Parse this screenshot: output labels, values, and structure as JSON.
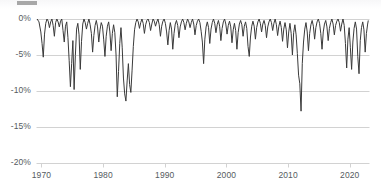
{
  "chart_data": {
    "type": "area",
    "title": "",
    "subtitle": "",
    "xlabel": "",
    "ylabel": "",
    "xlim": [
      1969.2,
      2023.2
    ],
    "ylim": [
      -20,
      0
    ],
    "grid": true,
    "legend_position": "none",
    "series_name": "Drawdown",
    "line_color": "#3a3a3a",
    "gridline_color": "#d2d2d2",
    "axis_text_color": "#555b61",
    "background_color": "#ffffff",
    "y_ticks": [
      "0%",
      "-5%",
      "-10%",
      "-15%",
      "-20%"
    ],
    "y_tick_values": [
      0,
      -5,
      -10,
      -15,
      -20
    ],
    "x_ticks": [
      "1970",
      "1980",
      "1990",
      "2000",
      "2010",
      "2020"
    ],
    "x_tick_values": [
      1970,
      1980,
      1990,
      2000,
      2010,
      2020
    ],
    "x": [
      1969.3,
      1969.6,
      1969.9,
      1970.1,
      1970.3,
      1970.5,
      1970.7,
      1970.9,
      1971.1,
      1971.3,
      1971.5,
      1971.7,
      1971.9,
      1972.1,
      1972.3,
      1972.5,
      1972.7,
      1972.9,
      1973.1,
      1973.3,
      1973.5,
      1973.7,
      1973.9,
      1974.1,
      1974.3,
      1974.5,
      1974.7,
      1974.9,
      1975.1,
      1975.3,
      1975.5,
      1975.7,
      1975.9,
      1976.1,
      1976.3,
      1976.5,
      1976.7,
      1976.9,
      1977.1,
      1977.3,
      1977.5,
      1977.7,
      1977.9,
      1978.1,
      1978.3,
      1978.5,
      1978.7,
      1978.9,
      1979.1,
      1979.3,
      1979.5,
      1979.7,
      1979.9,
      1980.1,
      1980.3,
      1980.5,
      1980.7,
      1980.9,
      1981.1,
      1981.3,
      1981.5,
      1981.7,
      1981.9,
      1982.1,
      1982.3,
      1982.5,
      1982.7,
      1982.9,
      1983.1,
      1983.3,
      1983.5,
      1983.7,
      1983.9,
      1984.1,
      1984.3,
      1984.5,
      1984.7,
      1984.9,
      1985.1,
      1985.3,
      1985.5,
      1985.7,
      1985.9,
      1986.1,
      1986.3,
      1986.5,
      1986.7,
      1986.9,
      1987.1,
      1987.3,
      1987.5,
      1987.7,
      1987.9,
      1988.1,
      1988.3,
      1988.5,
      1988.7,
      1988.9,
      1989.1,
      1989.3,
      1989.5,
      1989.7,
      1989.9,
      1990.1,
      1990.3,
      1990.5,
      1990.7,
      1990.9,
      1991.1,
      1991.3,
      1991.5,
      1991.7,
      1991.9,
      1992.1,
      1992.3,
      1992.5,
      1992.7,
      1992.9,
      1993.1,
      1993.3,
      1993.5,
      1993.7,
      1993.9,
      1994.1,
      1994.3,
      1994.5,
      1994.7,
      1994.9,
      1995.1,
      1995.3,
      1995.5,
      1995.7,
      1995.9,
      1996.1,
      1996.3,
      1996.5,
      1996.7,
      1996.9,
      1997.1,
      1997.3,
      1997.5,
      1997.7,
      1997.9,
      1998.1,
      1998.3,
      1998.5,
      1998.7,
      1998.9,
      1999.1,
      1999.3,
      1999.5,
      1999.7,
      1999.9,
      2000.1,
      2000.3,
      2000.5,
      2000.7,
      2000.9,
      2001.1,
      2001.3,
      2001.5,
      2001.7,
      2001.9,
      2002.1,
      2002.3,
      2002.5,
      2002.7,
      2002.9,
      2003.1,
      2003.3,
      2003.5,
      2003.7,
      2003.9,
      2004.1,
      2004.3,
      2004.5,
      2004.7,
      2004.9,
      2005.1,
      2005.3,
      2005.5,
      2005.7,
      2005.9,
      2006.1,
      2006.3,
      2006.5,
      2006.7,
      2006.9,
      2007.1,
      2007.3,
      2007.5,
      2007.7,
      2007.9,
      2008.1,
      2008.3,
      2008.5,
      2008.7,
      2008.9,
      2009.1,
      2009.3,
      2009.5,
      2009.7,
      2009.9,
      2010.1,
      2010.3,
      2010.5,
      2010.7,
      2010.9,
      2011.1,
      2011.3,
      2011.5,
      2011.7,
      2011.9,
      2012.1,
      2012.3,
      2012.5,
      2012.7,
      2012.9,
      2013.1,
      2013.3,
      2013.5,
      2013.7,
      2013.9,
      2014.1,
      2014.3,
      2014.5,
      2014.7,
      2014.9,
      2015.1,
      2015.3,
      2015.5,
      2015.7,
      2015.9,
      2016.1,
      2016.3,
      2016.5,
      2016.7,
      2016.9,
      2017.1,
      2017.3,
      2017.5,
      2017.7,
      2017.9,
      2018.1,
      2018.3,
      2018.5,
      2018.7,
      2018.9,
      2019.1,
      2019.3,
      2019.5,
      2019.7,
      2019.9,
      2020.1,
      2020.3,
      2020.5,
      2020.7,
      2020.9,
      2021.1,
      2021.3,
      2021.5,
      2021.7,
      2021.9,
      2022.1,
      2022.3,
      2022.5,
      2022.7,
      2022.9,
      2023.0
    ],
    "y": [
      0,
      -0.4,
      -1.8,
      -3.4,
      -5.3,
      -2.1,
      -0.6,
      0,
      -0.3,
      -1.2,
      -0.4,
      0,
      -0.9,
      -2.4,
      -0.5,
      0,
      -0.4,
      -1.1,
      -0.3,
      0,
      -1.6,
      -3.2,
      -1.0,
      -0.4,
      -2.6,
      -5.8,
      -9.4,
      -6.2,
      -3.0,
      -9.8,
      -5.1,
      -1.4,
      -0.6,
      -2.2,
      -7.0,
      -3.1,
      -0.7,
      0,
      -0.5,
      -1.4,
      -0.6,
      0,
      -0.8,
      -2.0,
      -4.6,
      -2.3,
      -0.9,
      -0.2,
      -1.1,
      -3.2,
      -1.5,
      -0.5,
      -1.0,
      -2.9,
      -5.2,
      -2.4,
      -1.0,
      -0.4,
      -1.8,
      -4.4,
      -2.0,
      -0.8,
      -1.9,
      -5.0,
      -10.8,
      -7.3,
      -3.4,
      -1.2,
      -4.0,
      -8.2,
      -10.4,
      -11.4,
      -8.6,
      -6.2,
      -9.1,
      -10.2,
      -7.1,
      -3.8,
      -1.5,
      -0.5,
      0,
      -0.4,
      -1.3,
      -0.5,
      0,
      -0.6,
      -2.0,
      -0.8,
      -0.2,
      0,
      -0.5,
      -1.6,
      -0.7,
      0,
      -0.3,
      -1.0,
      -0.4,
      0,
      -0.8,
      -2.4,
      -1.0,
      -0.3,
      0,
      -0.6,
      -1.8,
      -3.6,
      -1.6,
      -0.5,
      -1.4,
      -4.2,
      -2.0,
      -0.7,
      -0.2,
      -0.9,
      -2.6,
      -1.1,
      -0.4,
      0,
      -0.5,
      -1.5,
      -0.6,
      0,
      -0.4,
      -1.2,
      -0.5,
      0,
      -0.7,
      -2.2,
      -0.9,
      -0.3,
      0,
      -0.5,
      -1.7,
      -3.2,
      -6.2,
      -2.8,
      -1.1,
      -0.4,
      -1.2,
      -3.4,
      -1.4,
      -0.5,
      0,
      -0.6,
      -1.9,
      -0.8,
      -0.2,
      -1.0,
      -3.0,
      -1.3,
      -0.4,
      0,
      -0.7,
      -2.1,
      -0.9,
      -0.3,
      -1.1,
      -3.3,
      -1.5,
      -0.6,
      -1.6,
      -4.2,
      -1.9,
      -0.7,
      -0.2,
      -0.8,
      -2.4,
      -1.0,
      -0.4,
      -1.3,
      -3.8,
      -5.2,
      -2.5,
      -1.0,
      -0.3,
      -1.0,
      -2.8,
      -1.2,
      -0.4,
      0,
      -0.6,
      -1.8,
      -0.7,
      -0.2,
      -0.9,
      -2.6,
      -1.1,
      -0.4,
      0,
      -0.5,
      -1.6,
      -0.6,
      0,
      -0.8,
      -2.3,
      -1.0,
      -0.3,
      -1.2,
      -3.1,
      -1.4,
      -0.5,
      -1.5,
      -4.0,
      -1.8,
      -0.6,
      -2.0,
      -5.0,
      -1.9,
      -0.8,
      -2.2,
      -4.8,
      -7.8,
      -9.0,
      -12.8,
      -6.2,
      -3.2,
      -1.4,
      -0.5,
      -1.8,
      -4.4,
      -2.0,
      -0.8,
      -0.2,
      -1.0,
      -2.8,
      -1.2,
      -0.4,
      0,
      -0.6,
      -2.0,
      -4.2,
      -1.8,
      -0.7,
      -0.2,
      -1.1,
      -3.0,
      -1.3,
      -0.5,
      0,
      -0.7,
      -2.2,
      -0.9,
      -0.3,
      0,
      -0.5,
      -1.7,
      -0.7,
      0,
      -0.9,
      -3.4,
      -6.8,
      -2.8,
      -1.2,
      -4.0,
      -7.0,
      -3.2,
      -1.3,
      -0.4,
      -1.4,
      -5.2,
      -7.6,
      -3.0,
      -1.2,
      -0.4,
      -1.5,
      -4.6,
      -2.0,
      -0.7,
      -0.2,
      -0.8,
      -2.4,
      -1.0,
      -0.3,
      0,
      -0.6,
      -2.6,
      -6.2,
      -2.4,
      -0.9,
      -0.3,
      -1.2,
      -3.6,
      -1.5,
      -0.5,
      0,
      -0.7,
      -2.0,
      -0.8,
      -0.2,
      -1.6,
      -5.0,
      -15.5,
      -9.0,
      -4.2,
      -1.6,
      -0.5,
      0,
      -0.6,
      -1.8,
      -0.7,
      -0.2,
      -1.4,
      -4.8,
      -2.2,
      -0.8,
      -0.3,
      -1.0
    ]
  }
}
